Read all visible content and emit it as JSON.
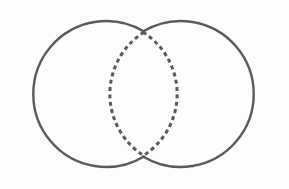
{
  "figure": {
    "name": "two-circle-venn-diagram",
    "background_color": "#fdfdfc",
    "canvas": {
      "width": 289,
      "height": 189
    },
    "line_color": "#5a5a5a",
    "dash_color": "#595959",
    "solid_stroke_width": 2.4,
    "dashed_stroke_width": 3.0,
    "dash_pattern": "4 3.4",
    "shapes": [
      {
        "id": "left-circle",
        "label": "Left circle",
        "style": "solid",
        "cx": 96,
        "cy": 94,
        "r": 73
      },
      {
        "id": "right-circle",
        "label": "Right circle",
        "style": "solid",
        "cx": 191,
        "cy": 94,
        "r": 73
      },
      {
        "id": "intersection-lens",
        "label": "Intersection lens",
        "style": "dashed",
        "left_bound_x": 118,
        "right_bound_x": 170,
        "top_y": 32,
        "bottom_y": 156
      }
    ],
    "intersection_points": [
      {
        "id": "top-crossing",
        "x": 144,
        "y": 32
      },
      {
        "id": "bottom-crossing",
        "x": 144,
        "y": 156
      }
    ],
    "paths": {
      "left_circle_outer": "M 144.0 31.5 A 73 73 0 1 0 144.0 156.5",
      "right_circle_outer": "M 143.0 31.5 A 73 73 0 1 1 143.0 156.5",
      "lens_left_edge": "M 144.0 32.2 A 73 73 0 0 0 144.0 155.8",
      "lens_right_edge": "M 143.0 32.2 A 73 73 0 0 1 143.0 155.8"
    }
  }
}
